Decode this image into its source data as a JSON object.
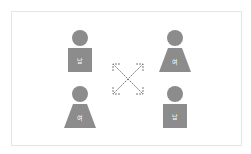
{
  "colors": {
    "figure": "#8c8c8c",
    "label": "#ffffff",
    "arrow": "#7a7a7a",
    "frame": "#e6e6e6"
  },
  "figures": [
    {
      "position": "top-left",
      "gender": "male",
      "shape": "square",
      "label": "남"
    },
    {
      "position": "top-right",
      "gender": "female",
      "shape": "trapezoid",
      "label": "여"
    },
    {
      "position": "bottom-left",
      "gender": "female",
      "shape": "trapezoid",
      "label": "여"
    },
    {
      "position": "bottom-right",
      "gender": "male",
      "shape": "square",
      "label": "남"
    }
  ],
  "center": {
    "icon": "crossed-double-arrows-icon",
    "style": "dashed"
  }
}
